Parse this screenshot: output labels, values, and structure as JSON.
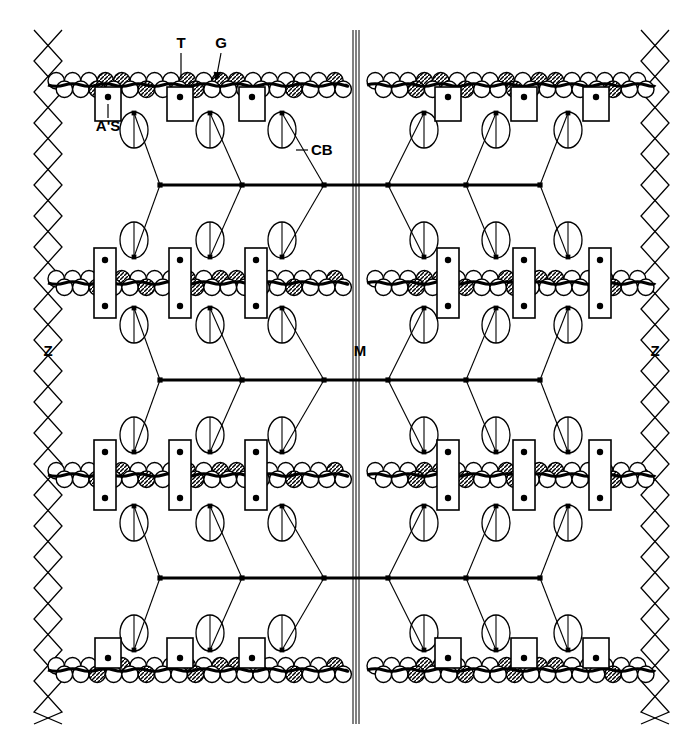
{
  "figure": {
    "background_color": "#ffffff",
    "ink_color": "#000000",
    "width": 700,
    "height": 754
  },
  "labels": [
    {
      "id": "T",
      "text": "T",
      "x": 181,
      "y": 48,
      "leader": "line",
      "anchor": "middle"
    },
    {
      "id": "G",
      "text": "G",
      "x": 221,
      "y": 48,
      "leader": "arrow",
      "anchor": "middle"
    },
    {
      "id": "AS",
      "text": "A'S",
      "x": 108,
      "y": 131,
      "leader": "line",
      "anchor": "middle"
    },
    {
      "id": "CB",
      "text": "CB",
      "x": 311,
      "y": 155,
      "leader": "dash",
      "anchor": "start"
    },
    {
      "id": "Z_left",
      "text": "Z",
      "x": 48,
      "y": 356,
      "leader": "none",
      "anchor": "middle"
    },
    {
      "id": "M",
      "text": "M",
      "x": 360,
      "y": 356,
      "leader": "none",
      "anchor": "middle"
    },
    {
      "id": "Z_right",
      "text": "Z",
      "x": 655,
      "y": 356,
      "leader": "none",
      "anchor": "middle"
    }
  ],
  "structures": {
    "z_lines": {
      "name": "z-line",
      "count": 2,
      "x_positions": [
        48,
        655
      ],
      "y_top": 30,
      "y_bottom": 724,
      "pattern": "criss-cross zigzag diamonds",
      "half_width": 14,
      "period": 62
    },
    "m_line": {
      "name": "m-line",
      "x": 356,
      "y_top": 30,
      "y_bottom": 724,
      "stroke_count": 3,
      "stroke_gap": 3
    },
    "thin_filaments": {
      "name": "actin-thin-filament",
      "description": "double row of beads with tropomyosin strand",
      "bead_radius": 8.2,
      "bead_pitch": 16.4,
      "rows_y": [
        85,
        283,
        475,
        670
      ],
      "segments": [
        {
          "x_start": 48,
          "x_end": 345
        },
        {
          "x_start": 367,
          "x_end": 655
        }
      ]
    },
    "thick_filaments": {
      "name": "myosin-thick-filament",
      "rows_y": [
        185,
        380,
        578
      ],
      "x_start": 112,
      "x_end": 600,
      "m_x": 356,
      "crossbridge": {
        "name": "cross-bridge",
        "head_rx": 14,
        "head_ry": 18,
        "arm_offset_y": 55
      },
      "crossbridge_x_left": [
        134,
        210,
        282
      ],
      "crossbridge_x_right": [
        424,
        496,
        568
      ],
      "node_x_left": [
        160,
        242,
        324
      ],
      "node_x_right": [
        388,
        466,
        540
      ]
    },
    "troponin_boxes": {
      "name": "troponin-box",
      "top_row": {
        "style": "below-chain-single-dot",
        "width": 26,
        "height": 34,
        "x_positions_left": [
          108,
          180,
          252
        ],
        "x_positions_right": [
          448,
          524,
          596
        ]
      },
      "middle_rows": {
        "style": "spanning-chain-two-dots",
        "width": 22,
        "height": 70,
        "x_positions_left": [
          105,
          180,
          256
        ],
        "x_positions_right": [
          448,
          524,
          600
        ]
      },
      "bottom_row": {
        "style": "above-chain-single-dot",
        "width": 26,
        "height": 30,
        "x_positions_left": [
          108,
          180,
          252
        ],
        "x_positions_right": [
          448,
          524,
          596
        ]
      }
    }
  },
  "legend_meanings": {
    "T": "troponin",
    "G": "G-actin monomer",
    "A'S": "actin site",
    "CB": "cross-bridge",
    "Z": "Z-line",
    "M": "M-line"
  }
}
